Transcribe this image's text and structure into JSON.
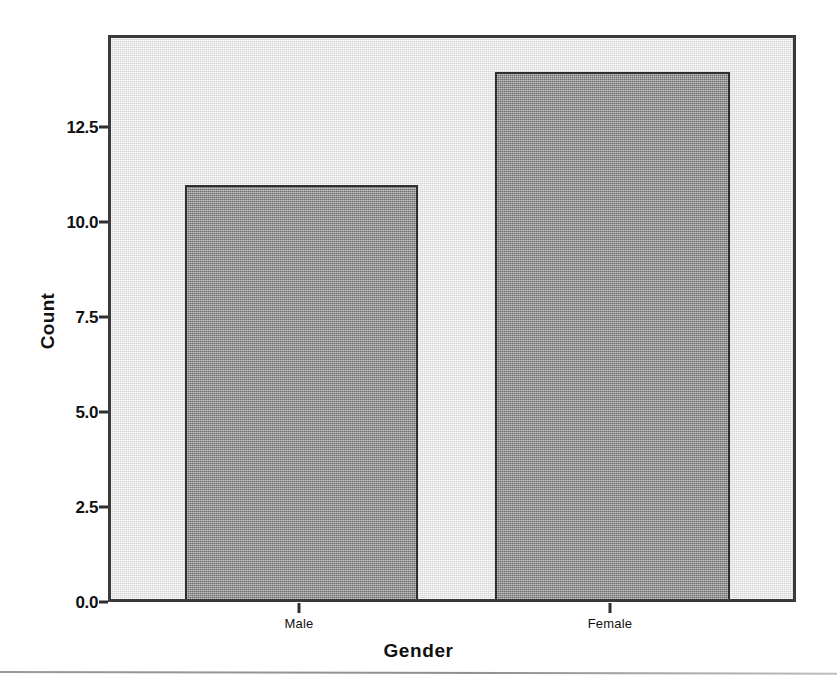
{
  "chart_data": {
    "type": "bar",
    "title": "",
    "subtitle": "",
    "xlabel": "Gender",
    "ylabel": "Count",
    "categories": [
      "Male",
      "Female"
    ],
    "values": [
      11,
      14
    ],
    "series": [
      {
        "name": "Count",
        "values": [
          11,
          14
        ]
      }
    ],
    "ylim": [
      0.0,
      14.9
    ],
    "y_ticks": [
      "0.0",
      "2.5",
      "5.0",
      "7.5",
      "10.0",
      "12.5"
    ],
    "y_tick_values": [
      0.0,
      2.5,
      5.0,
      7.5,
      10.0,
      12.5
    ],
    "x_ticks": [
      "Male",
      "Female"
    ],
    "grid": false,
    "legend": false,
    "legend_position": "none",
    "bar_fill_color": "#8d8d8d",
    "bar_border_color": "#2f2f2f",
    "panel_background_color": "#e9e9e9",
    "panel_border_color": "#3a3a3a",
    "page_background_color": "#ffffff",
    "axis_text_color": "#111111"
  },
  "figure": {
    "bottom_rule_color": "#9a9a9a"
  }
}
